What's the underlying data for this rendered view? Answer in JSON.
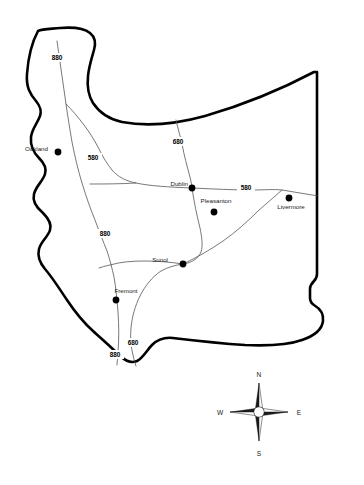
{
  "map": {
    "title": "Alameda County Highway Map",
    "background_color": "#ffffff",
    "outline_color": "#000000",
    "highway_color": "#555555",
    "city_dot_color": "#000000",
    "cities": [
      {
        "name": "Oakland",
        "label_x": 48,
        "label_y": 151,
        "label_anchor": "end",
        "dot_x": 58,
        "dot_y": 152,
        "dot_r": 3.4
      },
      {
        "name": "Dublin",
        "label_x": 188,
        "label_y": 186,
        "label_anchor": "end",
        "dot_x": 192,
        "dot_y": 188,
        "dot_r": 3.4
      },
      {
        "name": "Pleasanton",
        "label_x": 216,
        "label_y": 203,
        "label_anchor": "middle",
        "dot_x": 214,
        "dot_y": 212,
        "dot_r": 3.4
      },
      {
        "name": "Livermore",
        "label_x": 291,
        "label_y": 209,
        "label_anchor": "middle",
        "dot_x": 289,
        "dot_y": 198,
        "dot_r": 3.4
      },
      {
        "name": "Sunol",
        "label_x": 168,
        "label_y": 262,
        "label_anchor": "end",
        "dot_x": 183,
        "dot_y": 264,
        "dot_r": 3.4
      },
      {
        "name": "Fremont",
        "label_x": 126,
        "label_y": 293,
        "label_anchor": "middle",
        "dot_x": 116,
        "dot_y": 300,
        "dot_r": 3.4
      }
    ],
    "highway_labels": [
      {
        "number": "880",
        "x": 57,
        "y": 60,
        "w": 17,
        "h": 8
      },
      {
        "number": "580",
        "x": 93,
        "y": 160,
        "w": 17,
        "h": 8
      },
      {
        "number": "680",
        "x": 178,
        "y": 144,
        "w": 17,
        "h": 8
      },
      {
        "number": "580",
        "x": 246,
        "y": 190,
        "w": 17,
        "h": 8
      },
      {
        "number": "880",
        "x": 105,
        "y": 236,
        "w": 17,
        "h": 8
      },
      {
        "number": "680",
        "x": 133,
        "y": 345,
        "w": 17,
        "h": 8
      },
      {
        "number": "880",
        "x": 115,
        "y": 357,
        "w": 17,
        "h": 8
      }
    ],
    "compass": {
      "center_x": 259,
      "center_y": 412,
      "north_label": "N",
      "south_label": "S",
      "east_label": "E",
      "west_label": "W"
    }
  }
}
